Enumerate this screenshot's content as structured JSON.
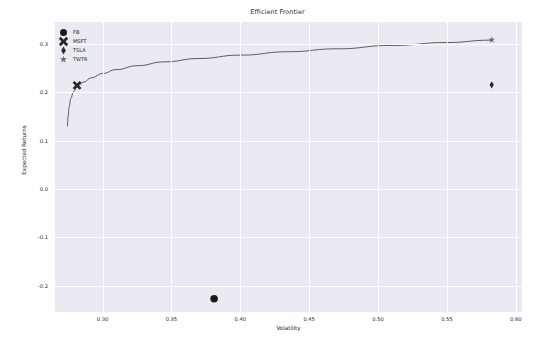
{
  "chart_data": {
    "type": "scatter",
    "title": "Efficient Frontier",
    "xlabel": "Volatility",
    "ylabel": "Expected Returns",
    "xlim": [
      0.2655,
      0.6045
    ],
    "ylim": [
      -0.2545,
      0.3455
    ],
    "xticks": [
      0.3,
      0.35,
      0.4,
      0.45,
      0.5,
      0.55,
      0.6
    ],
    "xticklabels": [
      "0.30",
      "0.35",
      "0.40",
      "0.45",
      "0.50",
      "0.55",
      "0.60"
    ],
    "yticks": [
      0.3,
      0.2,
      0.1,
      0.0,
      -0.1,
      -0.2
    ],
    "yticklabels": [
      "0.3",
      "0.2",
      "0.1",
      "0.0",
      "-0.1",
      "-0.2"
    ],
    "grid": true,
    "legend_position": "upper left",
    "series": [
      {
        "name": "Efficient Frontier",
        "type": "line",
        "color": "#4c4c4c",
        "points": [
          {
            "x": 0.2745,
            "y": 0.1295
          },
          {
            "x": 0.275,
            "y": 0.15
          },
          {
            "x": 0.2758,
            "y": 0.17
          },
          {
            "x": 0.277,
            "y": 0.188
          },
          {
            "x": 0.279,
            "y": 0.202
          },
          {
            "x": 0.282,
            "y": 0.213
          },
          {
            "x": 0.286,
            "y": 0.221
          },
          {
            "x": 0.292,
            "y": 0.23
          },
          {
            "x": 0.3,
            "y": 0.239
          },
          {
            "x": 0.31,
            "y": 0.247
          },
          {
            "x": 0.325,
            "y": 0.255
          },
          {
            "x": 0.345,
            "y": 0.263
          },
          {
            "x": 0.37,
            "y": 0.27
          },
          {
            "x": 0.4,
            "y": 0.277
          },
          {
            "x": 0.435,
            "y": 0.284
          },
          {
            "x": 0.47,
            "y": 0.29
          },
          {
            "x": 0.51,
            "y": 0.297
          },
          {
            "x": 0.55,
            "y": 0.303
          },
          {
            "x": 0.582,
            "y": 0.308
          }
        ]
      }
    ],
    "markers": [
      {
        "label": "FB",
        "marker": "circle",
        "x": 0.381,
        "y": -0.227,
        "color": "#1a1a1a",
        "size": 7.5
      },
      {
        "label": "MSFT",
        "marker": "x",
        "x": 0.2815,
        "y": 0.2145,
        "color": "#262626",
        "size": 7.0
      },
      {
        "label": "TSLA",
        "marker": "diamond",
        "x": 0.5825,
        "y": 0.2155,
        "color": "#2b2b2b",
        "size": 7.0
      },
      {
        "label": "TWTR",
        "marker": "star",
        "x": 0.5825,
        "y": 0.3085,
        "color": "#6e6e78",
        "size": 7.0
      }
    ]
  },
  "legend": {
    "items": [
      {
        "label": "FB",
        "marker": "circle"
      },
      {
        "label": "MSFT",
        "marker": "x"
      },
      {
        "label": "TSLA",
        "marker": "diamond"
      },
      {
        "label": "TWTR",
        "marker": "star"
      }
    ]
  },
  "style": {
    "plot_background": "#eaeaf2",
    "figure_background": "#ffffff",
    "grid_color": "#ffffff",
    "text_color": "#262626",
    "line_color": "#4c4c4c"
  }
}
